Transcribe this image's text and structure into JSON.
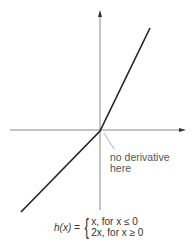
{
  "diagram": {
    "annotation": {
      "line1": "no derivative",
      "line2": "here"
    },
    "formula": {
      "lhs": "h(x) =",
      "case1": "x, for x ≤ 0",
      "case2": "2x, for x ≥ 0"
    },
    "colors": {
      "axis": "#888888",
      "curve": "#222222",
      "text": "#555555"
    }
  }
}
